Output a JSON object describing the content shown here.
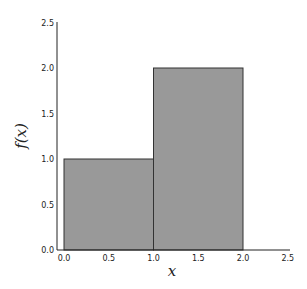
{
  "chart_data": {
    "type": "bar",
    "title": "",
    "xlabel": "x",
    "ylabel": "f(x)",
    "xlim": [
      0.0,
      2.5
    ],
    "ylim": [
      0.0,
      2.5
    ],
    "grid": false,
    "bars": [
      {
        "x_start": 0.0,
        "x_end": 1.0,
        "value": 1.0
      },
      {
        "x_start": 1.0,
        "x_end": 2.0,
        "value": 2.0
      }
    ],
    "x_ticks": [
      "0.0",
      "0.5",
      "1.0",
      "1.5",
      "2.0",
      "2.5"
    ],
    "y_ticks": [
      "0.0",
      "0.5",
      "1.0",
      "1.5",
      "2.0",
      "2.5"
    ],
    "bar_color": "#999999",
    "edge_color": "#333333"
  }
}
